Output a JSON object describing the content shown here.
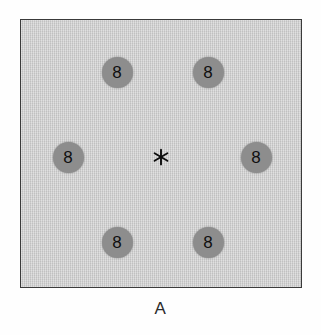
{
  "figure": {
    "panel_label": "A",
    "caption_position": "below",
    "background_color": "#ffffff"
  },
  "panel": {
    "name": "stimulus-display",
    "background_color": "#c9c9c9",
    "border_color": "#3a3a3a",
    "border_width_px": 1.4,
    "x": 20,
    "y": 19,
    "width": 282,
    "height": 269
  },
  "fixation": {
    "symbol": "*",
    "icon": "asterisk-icon",
    "color": "#0d0d0d",
    "center_x": 160,
    "center_y": 157,
    "points": 6
  },
  "stimuli": {
    "count": 6,
    "arrangement": "hexagonal-ring",
    "disk_diameter_px": 31,
    "disk_color": "#8d8d8d",
    "digit_color": "#101010",
    "items": [
      {
        "id": "disk-top-left",
        "label": "8",
        "center_x": 117,
        "center_y": 72,
        "position": "top-left"
      },
      {
        "id": "disk-top-right",
        "label": "8",
        "center_x": 208,
        "center_y": 72,
        "position": "top-right"
      },
      {
        "id": "disk-middle-left",
        "label": "8",
        "center_x": 68,
        "center_y": 157,
        "position": "middle-left"
      },
      {
        "id": "disk-middle-right",
        "label": "8",
        "center_x": 256,
        "center_y": 157,
        "position": "middle-right"
      },
      {
        "id": "disk-bottom-left",
        "label": "8",
        "center_x": 117,
        "center_y": 242,
        "position": "bottom-left"
      },
      {
        "id": "disk-bottom-right",
        "label": "8",
        "center_x": 208,
        "center_y": 242,
        "position": "bottom-right"
      }
    ]
  }
}
